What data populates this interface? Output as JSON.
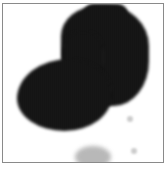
{
  "image": {
    "description": "Blurry monochrome blob with vertical stripe texture inside a thin gray frame",
    "colors": {
      "frame": "#8a8a8a",
      "blob": "#000000",
      "background": "#ffffff"
    }
  }
}
